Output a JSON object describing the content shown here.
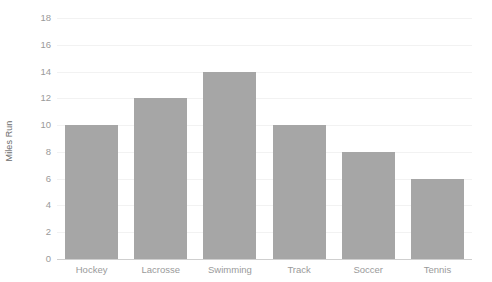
{
  "chart_data": {
    "type": "bar",
    "title": "",
    "subtitle": "",
    "xlabel": "",
    "ylabel": "Miles Run",
    "categories": [
      "Hockey",
      "Lacrosse",
      "Swimming",
      "Track",
      "Soccer",
      "Tennis"
    ],
    "values": [
      10,
      12,
      14,
      10,
      8,
      6
    ],
    "ylim": [
      0,
      18
    ],
    "ytick_labels": [
      "0",
      "2",
      "4",
      "6",
      "8",
      "10",
      "12",
      "14",
      "16",
      "18"
    ],
    "ytick_values": [
      0,
      2,
      4,
      6,
      8,
      10,
      12,
      14,
      16,
      18
    ],
    "grid": true,
    "legend": false,
    "legend_position": "none",
    "bar_color": "#a6a6a6",
    "gridline_color": "#f2f2f2",
    "axis_line_color": "#cfcfcf",
    "tick_label_color": "#9a9a9a",
    "axis_title_color": "#6b6b6b",
    "background_color": "#ffffff"
  }
}
